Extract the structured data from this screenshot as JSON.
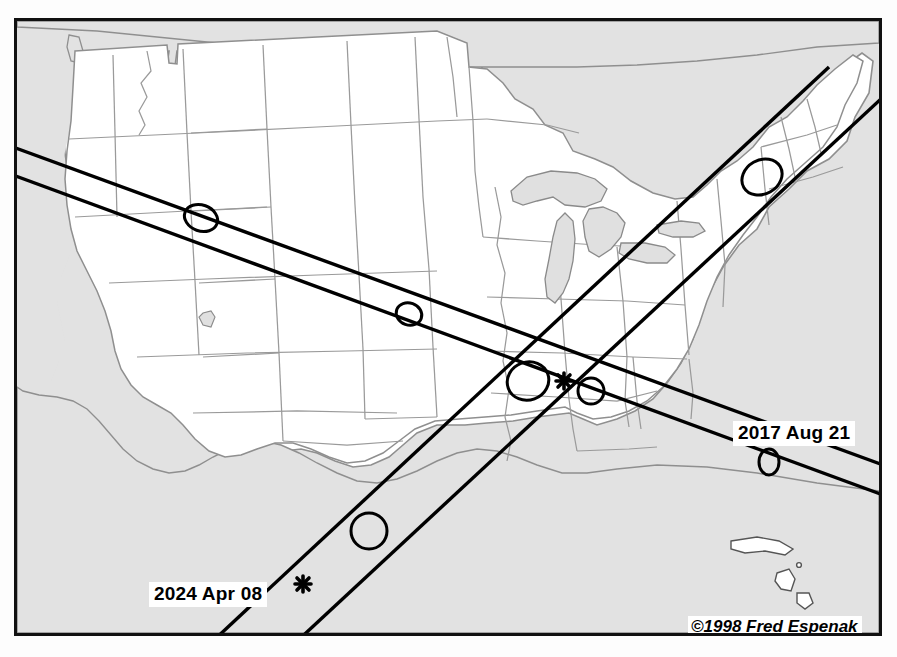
{
  "figure": {
    "kind": "eclipse-path-map",
    "region": "Continental United States",
    "credit": "©1998 Fred Espenak",
    "frame_color": "#111111",
    "ocean_color": "#e2e2e2",
    "land_color": "#ffffff",
    "state_border_color": "#999999",
    "path_line_color": "#000000",
    "shadow_outline_color": "#000000"
  },
  "labels": {
    "eclipse_2017": "2017 Aug 21",
    "eclipse_2024": "2024 Apr 08"
  },
  "map_data": {
    "type": "path-map",
    "title": "",
    "eclipse_tracks": [
      {
        "name": "2017 Aug 21",
        "label": "2017 Aug 21",
        "direction": "northwest to southeast",
        "entry_edge": "west",
        "exit_edge": "east",
        "umbral_shadow_markers": 4,
        "shadow_marker_regions": [
          "Idaho",
          "Nebraska",
          "Kentucky/Tennessee",
          "Atlantic off Florida"
        ]
      },
      {
        "name": "2024 Apr 08",
        "label": "2024 Apr 08",
        "direction": "southwest to northeast",
        "entry_edge": "south",
        "exit_edge": "northeast",
        "umbral_shadow_markers": 3,
        "shadow_marker_regions": [
          "Texas",
          "Illinois/Missouri",
          "New York/Vermont"
        ]
      }
    ],
    "intersection_markers": [
      {
        "name": "path-crossing-asterisk",
        "region": "southern Illinois / Missouri",
        "glyph": "asterisk"
      },
      {
        "name": "greatest-eclipse-asterisk-2024",
        "region": "Mexico / south Texas",
        "glyph": "asterisk"
      }
    ],
    "water_features": [
      "Pacific Ocean",
      "Atlantic Ocean",
      "Gulf of Mexico",
      "Great Lakes"
    ],
    "shaded_areas": [
      "ocean",
      "Canada",
      "Mexico",
      "Great Lakes",
      "Cuba",
      "Bahamas"
    ]
  }
}
